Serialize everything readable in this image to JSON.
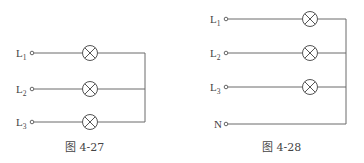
{
  "figures": [
    {
      "id": "fig-4-27",
      "caption": "图 4-27",
      "terminals": [
        {
          "letter": "L",
          "sub": "1"
        },
        {
          "letter": "L",
          "sub": "2"
        },
        {
          "letter": "L",
          "sub": "3"
        }
      ],
      "lamps": 3,
      "description": "Three lamps connected in star (Y) without neutral wire"
    },
    {
      "id": "fig-4-28",
      "caption": "图 4-28",
      "terminals": [
        {
          "letter": "L",
          "sub": "1"
        },
        {
          "letter": "L",
          "sub": "2"
        },
        {
          "letter": "L",
          "sub": "3"
        },
        {
          "letter": "N",
          "sub": ""
        }
      ],
      "lamps": 3,
      "description": "Three lamps connected in star (Y) with neutral wire N"
    }
  ],
  "colors": {
    "wire": "#6a6a6a",
    "text": "#444444",
    "background": "#ffffff"
  }
}
